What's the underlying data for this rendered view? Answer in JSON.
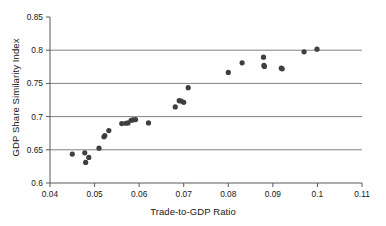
{
  "chart_data": {
    "type": "scatter",
    "title": "",
    "xlabel": "Trade-to-GDP Ratio",
    "ylabel": "GDP Share Similarity Index",
    "xlim": [
      0.04,
      0.11
    ],
    "ylim": [
      0.6,
      0.85
    ],
    "xticks": [
      "0.04",
      "0.05",
      "0.06",
      "0.07",
      "0.08",
      "0.09",
      "0.1",
      "0.11"
    ],
    "xtick_values": [
      0.04,
      0.05,
      0.06,
      0.07,
      0.08,
      0.09,
      0.1,
      0.11
    ],
    "yticks": [
      "0.6",
      "0.65",
      "0.7",
      "0.75",
      "0.8",
      "0.85"
    ],
    "ytick_values": [
      0.6,
      0.65,
      0.7,
      0.75,
      0.8,
      0.85
    ],
    "grid": "horizontal",
    "gridlines_y": [
      0.65,
      0.7,
      0.75,
      0.8
    ],
    "legend": "none",
    "marker": {
      "shape": "circle",
      "color": "#3f3f3f",
      "size": 2.6
    },
    "series": [
      {
        "name": "Country-pairs",
        "points": [
          {
            "x": 0.045,
            "y": 0.6435
          },
          {
            "x": 0.0478,
            "y": 0.6455
          },
          {
            "x": 0.048,
            "y": 0.631
          },
          {
            "x": 0.0487,
            "y": 0.6385
          },
          {
            "x": 0.051,
            "y": 0.6525
          },
          {
            "x": 0.0521,
            "y": 0.6695
          },
          {
            "x": 0.0523,
            "y": 0.6715
          },
          {
            "x": 0.0532,
            "y": 0.679
          },
          {
            "x": 0.0561,
            "y": 0.6895
          },
          {
            "x": 0.057,
            "y": 0.69
          },
          {
            "x": 0.0575,
            "y": 0.6905
          },
          {
            "x": 0.0582,
            "y": 0.6945
          },
          {
            "x": 0.0586,
            "y": 0.695
          },
          {
            "x": 0.0592,
            "y": 0.6955
          },
          {
            "x": 0.0621,
            "y": 0.6905
          },
          {
            "x": 0.0681,
            "y": 0.7145
          },
          {
            "x": 0.069,
            "y": 0.724
          },
          {
            "x": 0.0694,
            "y": 0.7235
          },
          {
            "x": 0.07,
            "y": 0.7215
          },
          {
            "x": 0.071,
            "y": 0.7435
          },
          {
            "x": 0.08,
            "y": 0.7665
          },
          {
            "x": 0.0831,
            "y": 0.781
          },
          {
            "x": 0.0879,
            "y": 0.7895
          },
          {
            "x": 0.088,
            "y": 0.777
          },
          {
            "x": 0.0881,
            "y": 0.7755
          },
          {
            "x": 0.0919,
            "y": 0.773
          },
          {
            "x": 0.0921,
            "y": 0.772
          },
          {
            "x": 0.097,
            "y": 0.7975
          },
          {
            "x": 0.0999,
            "y": 0.8015
          }
        ]
      }
    ],
    "colors": {
      "axis": "#595959",
      "gridline": "#808080",
      "marker": "#3f3f3f",
      "text": "#171717",
      "background": "#ffffff"
    },
    "geometry": {
      "plot_left": 50,
      "plot_right": 362,
      "plot_top": 17,
      "plot_bottom": 183
    }
  }
}
